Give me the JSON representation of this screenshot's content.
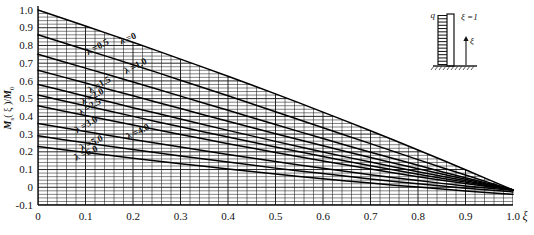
{
  "figure": {
    "ylabel": "M s ( ξ )/M 0",
    "ylabel_main": "M",
    "ylabel_sub": "s",
    "ylabel_arg": "( ξ )/",
    "ylabel_den": "M",
    "ylabel_den_sub": "0",
    "xlabel": "ξ",
    "caption": ""
  },
  "inset": {
    "load_label": "q",
    "top_label": "ξ =1",
    "axis_label": "ξ",
    "name": "cantilever-wall-under-distributed-load"
  },
  "chart_data": {
    "type": "line",
    "title": "",
    "xlabel": "ξ",
    "ylabel": "M_s(ξ)/M_0",
    "xlim": [
      0.0,
      1.0
    ],
    "ylim": [
      -0.1,
      1.0
    ],
    "xticks": [
      "0",
      "0.1",
      "0.2",
      "0.3",
      "0.4",
      "0.5",
      "0.6",
      "0.7",
      "0.8",
      "0.9",
      "1.0"
    ],
    "xtick_values": [
      0.0,
      0.1,
      0.2,
      0.3,
      0.4,
      0.5,
      0.6,
      0.7,
      0.8,
      0.9,
      1.0
    ],
    "yticks": [
      "1.0",
      "0.9",
      "0.8",
      "0.7",
      "0.6",
      "0.5",
      "0.4",
      "0.3",
      "0.2",
      "0.1",
      "0",
      "-0.1"
    ],
    "ytick_values": [
      1.0,
      0.9,
      0.8,
      0.7,
      0.6,
      0.5,
      0.4,
      0.3,
      0.2,
      0.1,
      0.0,
      -0.1
    ],
    "grid": true,
    "grid_minor_step_x": 0.02,
    "grid_minor_step_y": 0.02,
    "legend": "inline-curve-labels",
    "legend_position": "on-curves",
    "x": [
      0.0,
      0.05,
      0.1,
      0.15,
      0.2,
      0.25,
      0.3,
      0.35,
      0.4,
      0.45,
      0.5,
      0.55,
      0.6,
      0.65,
      0.7,
      0.75,
      0.8,
      0.85,
      0.9,
      0.95,
      1.0
    ],
    "series": [
      {
        "name": "λ =0",
        "lambda": 0.0,
        "values": [
          1.0,
          0.955,
          0.91,
          0.864,
          0.818,
          0.771,
          0.723,
          0.675,
          0.626,
          0.577,
          0.527,
          0.476,
          0.424,
          0.372,
          0.319,
          0.265,
          0.21,
          0.155,
          0.099,
          0.042,
          -0.015
        ]
      },
      {
        "name": "λ =0.5",
        "lambda": 0.5,
        "values": [
          0.86,
          0.818,
          0.776,
          0.734,
          0.691,
          0.648,
          0.604,
          0.56,
          0.516,
          0.471,
          0.426,
          0.381,
          0.336,
          0.291,
          0.246,
          0.201,
          0.156,
          0.112,
          0.069,
          0.026,
          -0.015
        ]
      },
      {
        "name": "λ =1.0",
        "lambda": 1.0,
        "values": [
          0.75,
          0.711,
          0.672,
          0.633,
          0.594,
          0.554,
          0.514,
          0.474,
          0.434,
          0.394,
          0.354,
          0.314,
          0.275,
          0.236,
          0.198,
          0.161,
          0.124,
          0.088,
          0.054,
          0.02,
          -0.015
        ]
      },
      {
        "name": "λ =1.5",
        "lambda": 1.5,
        "values": [
          0.66,
          0.624,
          0.588,
          0.552,
          0.516,
          0.48,
          0.444,
          0.408,
          0.373,
          0.337,
          0.302,
          0.268,
          0.234,
          0.2,
          0.168,
          0.136,
          0.105,
          0.075,
          0.045,
          0.015,
          -0.015
        ]
      },
      {
        "name": "λ =2.0",
        "lambda": 2.0,
        "values": [
          0.58,
          0.547,
          0.514,
          0.482,
          0.449,
          0.417,
          0.385,
          0.353,
          0.321,
          0.29,
          0.259,
          0.229,
          0.199,
          0.17,
          0.142,
          0.114,
          0.088,
          0.062,
          0.037,
          0.011,
          -0.015
        ]
      },
      {
        "name": "λ =2.5",
        "lambda": 2.5,
        "values": [
          0.52,
          0.49,
          0.46,
          0.43,
          0.4,
          0.37,
          0.341,
          0.312,
          0.283,
          0.255,
          0.227,
          0.2,
          0.173,
          0.147,
          0.122,
          0.098,
          0.074,
          0.051,
          0.029,
          0.007,
          -0.015
        ]
      },
      {
        "name": "λ =3.0",
        "lambda": 3.0,
        "values": [
          0.46,
          0.432,
          0.405,
          0.378,
          0.351,
          0.324,
          0.298,
          0.272,
          0.246,
          0.221,
          0.196,
          0.172,
          0.148,
          0.125,
          0.103,
          0.081,
          0.06,
          0.04,
          0.021,
          0.003,
          -0.015
        ]
      },
      {
        "name": "λ =4.0",
        "lambda": 4.0,
        "values": [
          0.36,
          0.337,
          0.314,
          0.292,
          0.27,
          0.248,
          0.227,
          0.206,
          0.185,
          0.165,
          0.145,
          0.126,
          0.107,
          0.089,
          0.071,
          0.054,
          0.038,
          0.022,
          0.007,
          -0.006,
          -0.018
        ]
      },
      {
        "name": "λ =5.0",
        "lambda": 5.0,
        "values": [
          0.29,
          0.27,
          0.251,
          0.232,
          0.213,
          0.195,
          0.177,
          0.159,
          0.142,
          0.125,
          0.108,
          0.092,
          0.077,
          0.062,
          0.047,
          0.033,
          0.02,
          0.007,
          -0.005,
          -0.016,
          -0.026
        ]
      },
      {
        "name": "λ =6.0",
        "lambda": 6.0,
        "values": [
          0.23,
          0.213,
          0.196,
          0.18,
          0.164,
          0.148,
          0.133,
          0.118,
          0.103,
          0.089,
          0.075,
          0.061,
          0.048,
          0.036,
          0.024,
          0.012,
          0.001,
          -0.01,
          -0.021,
          -0.031,
          -0.04
        ]
      }
    ],
    "curve_labels": [
      {
        "text": "λ =0",
        "x": 0.175,
        "y": 0.805,
        "rotate": -23
      },
      {
        "text": "λ =0.5",
        "x": 0.105,
        "y": 0.745,
        "rotate": -28
      },
      {
        "text": "λ =1.0",
        "x": 0.185,
        "y": 0.638,
        "rotate": -27
      },
      {
        "text": "λ =1.5",
        "x": 0.11,
        "y": 0.53,
        "rotate": -30
      },
      {
        "text": "λ =2.0",
        "x": 0.095,
        "y": 0.465,
        "rotate": -29
      },
      {
        "text": "λ =2.5",
        "x": 0.09,
        "y": 0.405,
        "rotate": -31
      },
      {
        "text": "λ =3.0",
        "x": 0.082,
        "y": 0.305,
        "rotate": -30
      },
      {
        "text": "λ =4.0",
        "x": 0.19,
        "y": 0.268,
        "rotate": -27
      },
      {
        "text": "λ =5.0",
        "x": 0.092,
        "y": 0.205,
        "rotate": -26
      },
      {
        "text": "λ =6.0",
        "x": 0.08,
        "y": 0.15,
        "rotate": -24
      }
    ]
  }
}
